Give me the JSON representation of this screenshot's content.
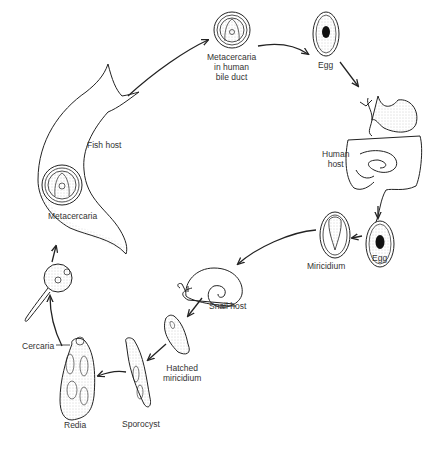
{
  "diagram": {
    "type": "life-cycle",
    "stages": [
      {
        "id": "metacercaria-bile",
        "label_lines": [
          "Metacercaria",
          "in human",
          "bile duct"
        ]
      },
      {
        "id": "egg-1",
        "label": "Egg"
      },
      {
        "id": "human-host",
        "label_lines": [
          "Human",
          "host"
        ]
      },
      {
        "id": "egg-2",
        "label": "Egg"
      },
      {
        "id": "miricidium",
        "label": "Miricidium"
      },
      {
        "id": "snail-host",
        "label": "Snail host"
      },
      {
        "id": "hatched-miricidium",
        "label_lines": [
          "Hatched",
          "miricidium"
        ]
      },
      {
        "id": "sporocyst",
        "label": "Sporocyst"
      },
      {
        "id": "redia",
        "label": "Redia"
      },
      {
        "id": "cercaria",
        "label": "Cercaria"
      },
      {
        "id": "metacercaria-fish",
        "label": "Metacercaria"
      },
      {
        "id": "fish-host",
        "label": "Fish host"
      }
    ],
    "arrows": [
      [
        "fish-host",
        "metacercaria-bile"
      ],
      [
        "metacercaria-bile",
        "egg-1"
      ],
      [
        "egg-1",
        "human-host"
      ],
      [
        "human-host",
        "egg-2"
      ],
      [
        "egg-2",
        "miricidium"
      ],
      [
        "miricidium",
        "snail-host"
      ],
      [
        "snail-host",
        "hatched-miricidium"
      ],
      [
        "hatched-miricidium",
        "sporocyst"
      ],
      [
        "sporocyst",
        "redia"
      ],
      [
        "redia",
        "cercaria"
      ],
      [
        "cercaria",
        "fish-host"
      ]
    ]
  },
  "labels": {
    "metacercaria_bile_1": "Metacercaria",
    "metacercaria_bile_2": "in human",
    "metacercaria_bile_3": "bile duct",
    "egg_top": "Egg",
    "human_host_1": "Human",
    "human_host_2": "host",
    "egg_right": "Egg",
    "miricidium": "Miricidium",
    "snail_host": "Snail host",
    "hatched_1": "Hatched",
    "hatched_2": "miricidium",
    "sporocyst": "Sporocyst",
    "redia": "Redia",
    "cercaria": "Cercaria",
    "metacercaria_fish": "Metacercaria",
    "fish_host": "Fish host"
  },
  "colors": {
    "line": "#222222",
    "stipple": "#cfcfcf",
    "background": "#ffffff"
  }
}
